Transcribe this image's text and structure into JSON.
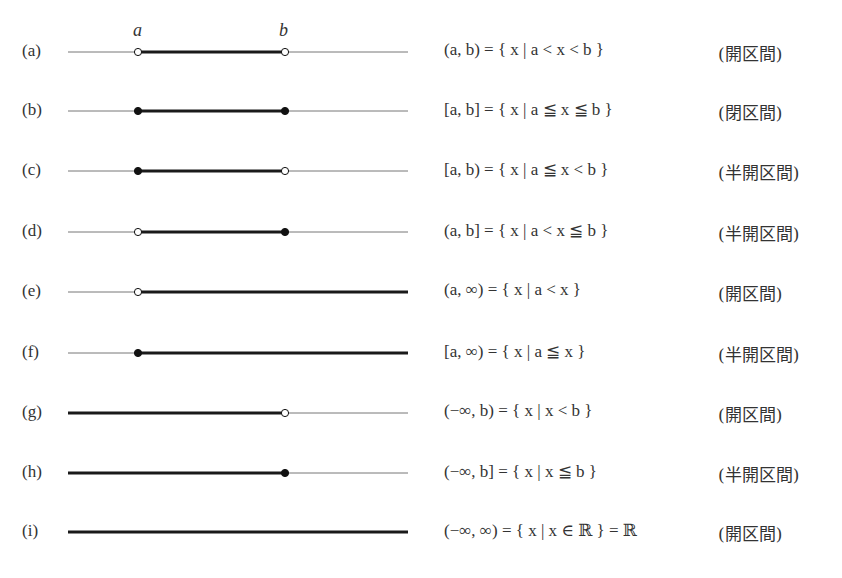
{
  "diagram": {
    "endpoint_labels": {
      "a": "a",
      "b": "b"
    },
    "geometry": {
      "line_start": 2,
      "line_end": 342,
      "a_x": 72,
      "b_x": 219
    },
    "colors": {
      "thin_line": "#777777",
      "thick_line": "#1a1a1a",
      "point": "#111111"
    },
    "rows": [
      {
        "id": "a",
        "label": "(a)",
        "formula": "(a, b) = { x | a < x < b }",
        "kind": "(開区間)",
        "segment": "ab",
        "a_point": "open",
        "b_point": "open"
      },
      {
        "id": "b",
        "label": "(b)",
        "formula": "[a, b] = { x | a ≦ x ≦ b }",
        "kind": "(閉区間)",
        "segment": "ab",
        "a_point": "closed",
        "b_point": "closed"
      },
      {
        "id": "c",
        "label": "(c)",
        "formula": "[a, b) = { x | a ≦ x < b }",
        "kind": "(半開区間)",
        "segment": "ab",
        "a_point": "closed",
        "b_point": "open"
      },
      {
        "id": "d",
        "label": "(d)",
        "formula": "(a, b] = { x | a < x ≦ b }",
        "kind": "(半開区間)",
        "segment": "ab",
        "a_point": "open",
        "b_point": "closed"
      },
      {
        "id": "e",
        "label": "(e)",
        "formula": "(a, ∞) = { x | a < x }",
        "kind": "(開区間)",
        "segment": "a_inf",
        "a_point": "open",
        "b_point": "none"
      },
      {
        "id": "f",
        "label": "(f)",
        "formula": "[a, ∞) = { x | a ≦ x }",
        "kind": "(半開区間)",
        "segment": "a_inf",
        "a_point": "closed",
        "b_point": "none"
      },
      {
        "id": "g",
        "label": "(g)",
        "formula": "(−∞, b) = { x | x < b }",
        "kind": "(開区間)",
        "segment": "inf_b",
        "a_point": "none",
        "b_point": "open"
      },
      {
        "id": "h",
        "label": "(h)",
        "formula": "(−∞, b] = { x | x ≦ b }",
        "kind": "(半開区間)",
        "segment": "inf_b",
        "a_point": "none",
        "b_point": "closed"
      },
      {
        "id": "i",
        "label": "(i)",
        "formula": "(−∞, ∞) = { x | x ∈ ℝ } = ℝ",
        "kind": "(開区間)",
        "segment": "all",
        "a_point": "none",
        "b_point": "none"
      }
    ]
  }
}
